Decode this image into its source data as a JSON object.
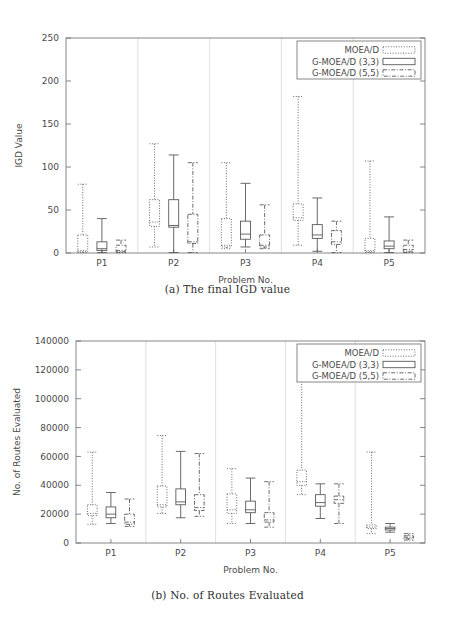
{
  "figures": [
    {
      "id": "a",
      "caption": "(a) The final IGD value",
      "legend": [
        {
          "label": "MOEA/D",
          "style": "dot"
        },
        {
          "label": "G-MOEA/D (3,3)",
          "style": "solid"
        },
        {
          "label": "G-MOEA/D (5,5)",
          "style": "dashdot"
        }
      ],
      "chart_data": {
        "type": "box",
        "title": "",
        "xlabel": "Problem No.",
        "ylabel": "IGD Value",
        "categories": [
          "P1",
          "P2",
          "P3",
          "P4",
          "P5"
        ],
        "xtick_labels": [
          "P1",
          "P2",
          "P3",
          "P4",
          "P5"
        ],
        "ytick_labels": [
          "0",
          "50",
          "100",
          "150",
          "200",
          "250"
        ],
        "yticks": [
          0,
          50,
          100,
          150,
          200,
          250
        ],
        "ylim": [
          0,
          250
        ],
        "grid": false,
        "legend_position": "top-right",
        "series": [
          {
            "name": "MOEA/D",
            "style": "dot",
            "boxes": [
              {
                "category": "P1",
                "min": 0.5,
                "q1": 1.5,
                "median": 3.0,
                "q3": 21.0,
                "max": 80.0
              },
              {
                "category": "P2",
                "min": 7.0,
                "q1": 31.0,
                "median": 36.0,
                "q3": 62.0,
                "max": 127.0
              },
              {
                "category": "P3",
                "min": 5.0,
                "q1": 7.0,
                "median": 9.0,
                "q3": 40.0,
                "max": 105.0
              },
              {
                "category": "P4",
                "min": 9.0,
                "q1": 38.0,
                "median": 41.0,
                "q3": 57.0,
                "max": 182.0
              },
              {
                "category": "P5",
                "min": 0.5,
                "q1": 1.5,
                "median": 3.0,
                "q3": 17.0,
                "max": 107.0
              }
            ]
          },
          {
            "name": "G-MOEA/D (3,3)",
            "style": "solid",
            "boxes": [
              {
                "category": "P1",
                "min": 0.5,
                "q1": 3.0,
                "median": 5.0,
                "q3": 13.0,
                "max": 40.0
              },
              {
                "category": "P2",
                "min": 0.5,
                "q1": 30.0,
                "median": 32.0,
                "q3": 62.0,
                "max": 114.0
              },
              {
                "category": "P3",
                "min": 7.0,
                "q1": 16.0,
                "median": 22.0,
                "q3": 37.0,
                "max": 81.0
              },
              {
                "category": "P4",
                "min": 2.0,
                "q1": 17.0,
                "median": 21.0,
                "q3": 33.0,
                "max": 64.0
              },
              {
                "category": "P5",
                "min": 0.5,
                "q1": 5.0,
                "median": 8.0,
                "q3": 14.0,
                "max": 42.0
              }
            ]
          },
          {
            "name": "G-MOEA/D (5,5)",
            "style": "dashdot",
            "boxes": [
              {
                "category": "P1",
                "min": 0.5,
                "q1": 1.5,
                "median": 3.0,
                "q3": 9.0,
                "max": 15.0
              },
              {
                "category": "P2",
                "min": 0.5,
                "q1": 11.0,
                "median": 13.0,
                "q3": 45.0,
                "max": 105.0
              },
              {
                "category": "P3",
                "min": 5.0,
                "q1": 7.0,
                "median": 9.0,
                "q3": 21.0,
                "max": 56.0
              },
              {
                "category": "P4",
                "min": 0.5,
                "q1": 10.0,
                "median": 13.0,
                "q3": 26.0,
                "max": 37.0
              },
              {
                "category": "P5",
                "min": 0.5,
                "q1": 2.0,
                "median": 4.0,
                "q3": 9.0,
                "max": 15.0
              }
            ]
          }
        ]
      }
    },
    {
      "id": "b",
      "caption": "(b) No. of Routes Evaluated",
      "legend": [
        {
          "label": "MOEA/D",
          "style": "dot"
        },
        {
          "label": "G-MOEA/D (3,3)",
          "style": "solid"
        },
        {
          "label": "G-MOEA/D (5,5)",
          "style": "dashdot"
        }
      ],
      "chart_data": {
        "type": "box",
        "title": "",
        "xlabel": "Problem No.",
        "ylabel": "No. of Routes Evaluated",
        "categories": [
          "P1",
          "P2",
          "P3",
          "P4",
          "P5"
        ],
        "xtick_labels": [
          "P1",
          "P2",
          "P3",
          "P4",
          "P5"
        ],
        "ytick_labels": [
          "0",
          "20000",
          "40000",
          "60000",
          "80000",
          "100000",
          "120000",
          "140000"
        ],
        "yticks": [
          0,
          20000,
          40000,
          60000,
          80000,
          100000,
          120000,
          140000
        ],
        "ylim": [
          0,
          140000
        ],
        "grid": false,
        "legend_position": "top-right",
        "series": [
          {
            "name": "MOEA/D",
            "style": "dot",
            "boxes": [
              {
                "category": "P1",
                "min": 13000,
                "q1": 19000,
                "median": 20500,
                "q3": 26500,
                "max": 63000
              },
              {
                "category": "P2",
                "min": 20500,
                "q1": 25000,
                "median": 26500,
                "q3": 39500,
                "max": 74500
              },
              {
                "category": "P3",
                "min": 13500,
                "q1": 20500,
                "median": 23000,
                "q3": 34000,
                "max": 51500
              },
              {
                "category": "P4",
                "min": 33500,
                "q1": 40000,
                "median": 42500,
                "q3": 50500,
                "max": 112000
              },
              {
                "category": "P5",
                "min": 6500,
                "q1": 10000,
                "median": 11000,
                "q3": 12500,
                "max": 63000
              }
            ]
          },
          {
            "name": "G-MOEA/D (3,3)",
            "style": "solid",
            "boxes": [
              {
                "category": "P1",
                "min": 13500,
                "q1": 17500,
                "median": 20000,
                "q3": 25000,
                "max": 35000
              },
              {
                "category": "P2",
                "min": 17500,
                "q1": 26500,
                "median": 28500,
                "q3": 37500,
                "max": 63500
              },
              {
                "category": "P3",
                "min": 13500,
                "q1": 21000,
                "median": 23000,
                "q3": 29000,
                "max": 45000
              },
              {
                "category": "P4",
                "min": 17000,
                "q1": 25500,
                "median": 28000,
                "q3": 33500,
                "max": 41000
              },
              {
                "category": "P5",
                "min": 7500,
                "q1": 9000,
                "median": 10000,
                "q3": 11000,
                "max": 13500
              }
            ]
          },
          {
            "name": "G-MOEA/D (5,5)",
            "style": "dashdot",
            "boxes": [
              {
                "category": "P1",
                "min": 11500,
                "q1": 13000,
                "median": 14500,
                "q3": 20000,
                "max": 30500
              },
              {
                "category": "P2",
                "min": 18500,
                "q1": 22500,
                "median": 24500,
                "q3": 33500,
                "max": 62000
              },
              {
                "category": "P3",
                "min": 11000,
                "q1": 14500,
                "median": 16000,
                "q3": 21000,
                "max": 42500
              },
              {
                "category": "P4",
                "min": 13500,
                "q1": 27500,
                "median": 30000,
                "q3": 32500,
                "max": 41000
              },
              {
                "category": "P5",
                "min": 2000,
                "q1": 3000,
                "median": 4000,
                "q3": 5000,
                "max": 6500
              }
            ]
          }
        ]
      }
    }
  ]
}
